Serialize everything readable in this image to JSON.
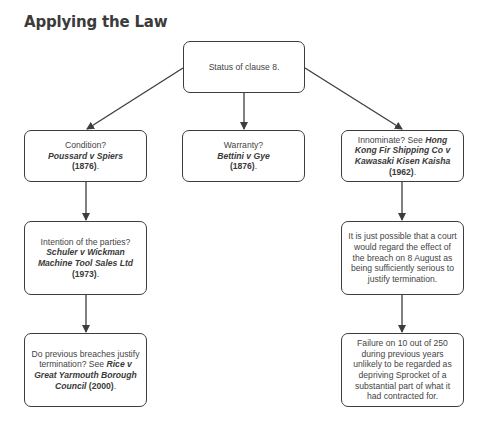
{
  "title": "Applying the Law",
  "nodes": {
    "root": {
      "text": "Status of clause 8."
    },
    "condition": {
      "lead": "Condition?",
      "case": "Poussard v Spiers",
      "year": "(1876)",
      "tail": "."
    },
    "warranty": {
      "lead": "Warranty?",
      "case": "Bettini v Gye",
      "year": "(1876)",
      "tail": "."
    },
    "innominate": {
      "lead": "Innominate? See ",
      "case": "Hong Kong Fir Shipping Co v Kawasaki Kisen Kaisha",
      "year": "(1962)",
      "tail": "."
    },
    "intention": {
      "lead": "Intention of the parties?",
      "case": "Schuler v Wickman Machine Tool Sales Ltd",
      "year": "(1973)",
      "tail": "."
    },
    "previous_breaches": {
      "lead": "Do previous breaches justify termination? See ",
      "case": "Rice v Great Yarmouth Borough Council",
      "year": "(2000)",
      "tail": "."
    },
    "possible": {
      "text": "It is just possible that a court would regard the effect of the breach on 8 August as being sufficiently serious to justify termination."
    },
    "failure": {
      "text": "Failure on 10 out of 250 during previous years unlikely to be regarded as depriving Sprocket of a substantial part of what it had contracted for."
    }
  },
  "edges": [
    {
      "from": "root",
      "to": "condition"
    },
    {
      "from": "root",
      "to": "warranty"
    },
    {
      "from": "root",
      "to": "innominate"
    },
    {
      "from": "condition",
      "to": "intention"
    },
    {
      "from": "intention",
      "to": "previous_breaches"
    },
    {
      "from": "innominate",
      "to": "possible"
    },
    {
      "from": "possible",
      "to": "failure"
    }
  ],
  "colors": {
    "line": "#3d3d3d",
    "text": "#444444",
    "background": "#ffffff"
  }
}
